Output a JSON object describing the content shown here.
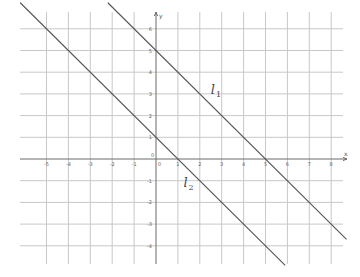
{
  "chart_data": {
    "type": "line",
    "title": "",
    "xlabel": "x",
    "ylabel": "y",
    "origin_label": "0",
    "xlim": [
      -6.2,
      8.5
    ],
    "ylim": [
      -4.8,
      6.8
    ],
    "grid": true,
    "x_ticks": [
      -5,
      -4,
      -3,
      -2,
      -1,
      1,
      2,
      3,
      4,
      5,
      6,
      7,
      8
    ],
    "y_ticks": [
      6,
      5,
      4,
      3,
      2,
      1,
      -1,
      -2,
      -3,
      -4
    ],
    "series": [
      {
        "name": "l1",
        "label_main": "l",
        "label_sub": "1",
        "equation": "y = 5 - x",
        "x_range": [
          -2.2,
          8.7
        ],
        "label_at": [
          2.5,
          3.0
        ]
      },
      {
        "name": "l2",
        "label_main": "l",
        "label_sub": "2",
        "equation": "y = 1 - x",
        "x_range": [
          -6.2,
          5.9
        ],
        "label_at": [
          1.25,
          -1.3
        ]
      }
    ]
  }
}
